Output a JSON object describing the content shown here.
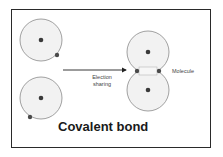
{
  "diagram": {
    "title": "Covalent bond",
    "arrow_label": "Election sharing",
    "arrow_label_lines": [
      "Election",
      "sharing"
    ],
    "product_label": "Molecule",
    "atoms_left": [
      {
        "name": "atom-1",
        "cx": 41,
        "cy": 40,
        "r": 21,
        "electron": {
          "cx": 57,
          "cy": 55
        }
      },
      {
        "name": "atom-2",
        "cx": 41,
        "cy": 98,
        "r": 21,
        "electron": {
          "cx": 30,
          "cy": 117
        }
      }
    ],
    "molecule_atoms": [
      {
        "name": "molecule-atom-top",
        "cx": 148,
        "cy": 52,
        "r": 21
      },
      {
        "name": "molecule-atom-bottom",
        "cx": 148,
        "cy": 90,
        "r": 21
      }
    ],
    "shared_electrons": [
      {
        "cx": 137,
        "cy": 71
      },
      {
        "cx": 159,
        "cy": 71
      }
    ],
    "colors": {
      "frame": "#2a2a2a",
      "shell_stroke": "#8a8a8a",
      "shell_fill": "#f2f2f2",
      "nucleus": "#3a3a3a",
      "electron": "#4a4a4a",
      "arrow": "#222222"
    }
  }
}
